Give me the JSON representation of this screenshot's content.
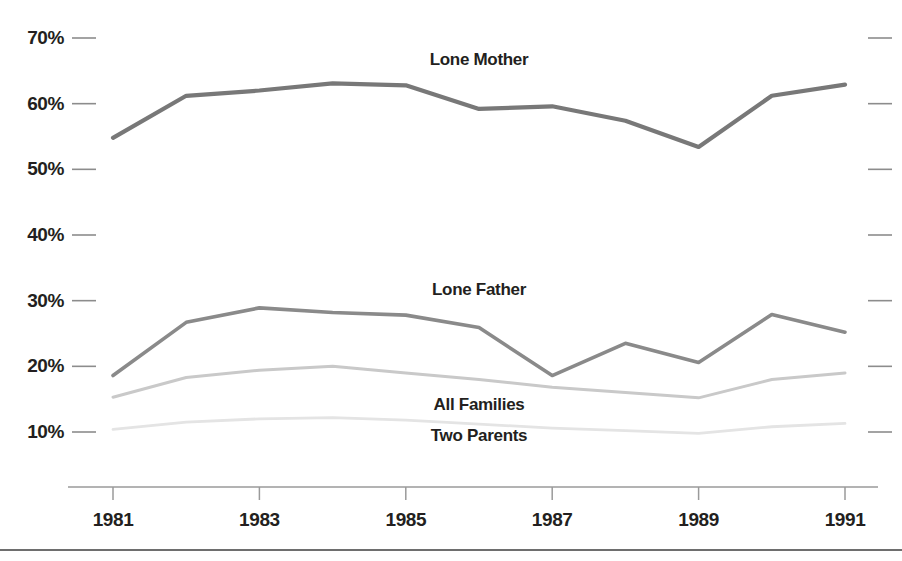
{
  "chart_data": {
    "type": "line",
    "title": "",
    "subtitle": "",
    "xlabel": "",
    "ylabel": "",
    "x": [
      1981,
      1982,
      1983,
      1984,
      1985,
      1986,
      1987,
      1988,
      1989,
      1990,
      1991
    ],
    "xtick_labels": [
      "1981",
      "1983",
      "1985",
      "1987",
      "1989",
      "1991"
    ],
    "xtick_values": [
      1981,
      1983,
      1985,
      1987,
      1989,
      1991
    ],
    "ytick_labels": [
      "70%",
      "60%",
      "50%",
      "40%",
      "30%",
      "20%",
      "10%"
    ],
    "ytick_values": [
      70,
      60,
      50,
      40,
      30,
      20,
      10
    ],
    "xlim": [
      1981,
      1991
    ],
    "ylim": [
      6,
      73
    ],
    "grid": false,
    "legend": "inline-labels",
    "series": [
      {
        "name": "Lone Mother",
        "color": "#787878",
        "width": 4.2,
        "label_x": 1986.0,
        "label_y": 66.6,
        "values": [
          54.8,
          61.2,
          62.0,
          63.1,
          62.8,
          59.2,
          59.6,
          57.4,
          53.4,
          61.2,
          62.9
        ]
      },
      {
        "name": "Lone Father",
        "color": "#8a8a8a",
        "width": 3.6,
        "label_x": 1986.0,
        "label_y": 31.6,
        "values": [
          18.6,
          26.7,
          28.9,
          28.2,
          27.8,
          25.9,
          18.6,
          23.5,
          20.6,
          27.9,
          25.2
        ]
      },
      {
        "name": "All Families",
        "color": "#c9c9c9",
        "width": 3.0,
        "label_x": 1986.0,
        "label_y": 14.1,
        "values": [
          15.3,
          18.3,
          19.4,
          20.0,
          19.0,
          18.0,
          16.8,
          16.0,
          15.2,
          18.0,
          19.0
        ]
      },
      {
        "name": "Two Parents",
        "color": "#e4e4e4",
        "width": 2.8,
        "label_x": 1986.0,
        "label_y": 9.4,
        "values": [
          10.4,
          11.5,
          12.0,
          12.2,
          11.8,
          11.2,
          10.6,
          10.2,
          9.8,
          10.8,
          11.3
        ]
      }
    ],
    "axis_color": "#9a9a9a",
    "tick_color": "#8c8c8c",
    "text_color": "#231f20",
    "background": "#ffffff"
  },
  "decor": {
    "baseline_color": "#6e6e6e",
    "right_ticks_note": "short right-edge ticks mirror y-axis ticks"
  }
}
